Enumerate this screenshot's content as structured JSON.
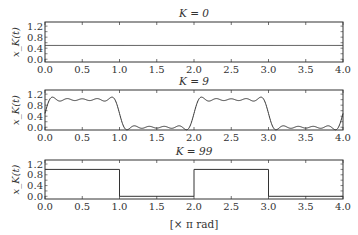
{
  "chart_data": [
    {
      "type": "line",
      "title": "K = 0",
      "K": 0,
      "xlabel": "",
      "ylabel": "x_K(t)",
      "xlim": [
        0.0,
        4.0
      ],
      "ylim": [
        -0.1,
        1.35
      ],
      "xticks": [
        "0.0",
        "0.5",
        "1.0",
        "1.5",
        "2.0",
        "2.5",
        "3.0",
        "3.5",
        "4.0"
      ],
      "yticks": [
        "0.0",
        "0.4",
        "0.8",
        "1.2"
      ],
      "series": [
        {
          "name": "x_K(t)",
          "description": "constant DC term",
          "x": [
            0.0,
            4.0
          ],
          "values": [
            0.5,
            0.5
          ]
        }
      ],
      "grid": false
    },
    {
      "type": "line",
      "title": "K = 9",
      "K": 9,
      "xlabel": "",
      "ylabel": "x_K(t)",
      "xlim": [
        0.0,
        4.0
      ],
      "ylim": [
        -0.1,
        1.35
      ],
      "xticks": [
        "0.0",
        "0.5",
        "1.0",
        "1.5",
        "2.0",
        "2.5",
        "3.0",
        "3.5",
        "4.0"
      ],
      "yticks": [
        "0.0",
        "0.4",
        "0.8",
        "1.2"
      ],
      "series": [
        {
          "name": "x_K(t)",
          "description": "Fourier partial sum of square wave (period 2π), high 0–1, low 1–2, with Gibbs ripples ~±0.09",
          "x": [
            0.0,
            0.05,
            0.5,
            0.95,
            1.0,
            1.05,
            1.5,
            1.95,
            2.0,
            2.05,
            2.5,
            2.95,
            3.0,
            3.05,
            3.5,
            3.95,
            4.0
          ],
          "values": [
            0.5,
            1.09,
            1.0,
            1.09,
            0.5,
            -0.09,
            0.0,
            -0.09,
            0.5,
            1.09,
            1.0,
            1.09,
            0.5,
            -0.09,
            0.0,
            -0.09,
            0.5
          ]
        }
      ],
      "grid": false
    },
    {
      "type": "line",
      "title": "K = 99",
      "K": 99,
      "xlabel": "[× π rad]",
      "ylabel": "x_K(t)",
      "xlim": [
        0.0,
        4.0
      ],
      "ylim": [
        -0.1,
        1.35
      ],
      "xticks": [
        "0.0",
        "0.5",
        "1.0",
        "1.5",
        "2.0",
        "2.5",
        "3.0",
        "3.5",
        "4.0"
      ],
      "yticks": [
        "0.0",
        "0.4",
        "0.8",
        "1.2"
      ],
      "series": [
        {
          "name": "x_K(t)",
          "description": "near-ideal square wave",
          "x": [
            0.0,
            1.0,
            1.0,
            2.0,
            2.0,
            3.0,
            3.0,
            4.0
          ],
          "values": [
            1.0,
            1.0,
            0.0,
            0.0,
            1.0,
            1.0,
            0.0,
            0.0
          ]
        }
      ],
      "grid": false
    }
  ],
  "panels": [
    {
      "title": "K = 0",
      "ylabel": "x_K(t)"
    },
    {
      "title": "K = 9",
      "ylabel": "x_K(t)"
    },
    {
      "title": "K = 99",
      "ylabel": "x_K(t)"
    }
  ],
  "xlabel": "[× π rad]",
  "colors": {
    "line": "#333333",
    "axes": "#333333",
    "background": "#ffffff"
  }
}
